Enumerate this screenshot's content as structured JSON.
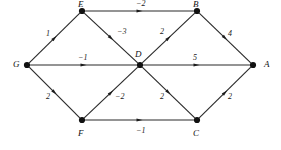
{
  "figure": {
    "kind": "directed-weighted-graph",
    "background_color": "#ffffff",
    "edge_color": "#2a2a2a",
    "node_color": "#111111"
  },
  "nodes": [
    {
      "id": "G",
      "label": "G",
      "x": 27,
      "y": 65,
      "label_x": 13,
      "label_y": 60
    },
    {
      "id": "E",
      "label": "E",
      "x": 82,
      "y": 11,
      "label_x": 78,
      "label_y": 0
    },
    {
      "id": "F",
      "label": "F",
      "x": 82,
      "y": 120,
      "label_x": 78,
      "label_y": 129
    },
    {
      "id": "D",
      "label": "D",
      "x": 140,
      "y": 65,
      "label_x": 135,
      "label_y": 50
    },
    {
      "id": "B",
      "label": "B",
      "x": 197,
      "y": 11,
      "label_x": 193,
      "label_y": 0
    },
    {
      "id": "C",
      "label": "C",
      "x": 197,
      "y": 120,
      "label_x": 193,
      "label_y": 129
    },
    {
      "id": "A",
      "label": "A",
      "x": 253,
      "y": 65,
      "label_x": 264,
      "label_y": 60
    }
  ],
  "edges": [
    {
      "id": "G-E",
      "from": "G",
      "to": "E",
      "weight": "1",
      "label_x": 46,
      "label_y": 30
    },
    {
      "id": "G-D",
      "from": "G",
      "to": "D",
      "weight": "−1",
      "label_x": 78,
      "label_y": 54
    },
    {
      "id": "G-F",
      "from": "G",
      "to": "F",
      "weight": "2",
      "label_x": 46,
      "label_y": 93
    },
    {
      "id": "E-B",
      "from": "E",
      "to": "B",
      "weight": "−2",
      "label_x": 136,
      "label_y": 0
    },
    {
      "id": "E-D",
      "from": "E",
      "to": "D",
      "weight": "−3",
      "label_x": 117,
      "label_y": 28
    },
    {
      "id": "D-B",
      "from": "D",
      "to": "B",
      "weight": "2",
      "label_x": 160,
      "label_y": 28
    },
    {
      "id": "D-A",
      "from": "D",
      "to": "A",
      "weight": "5",
      "label_x": 193,
      "label_y": 54
    },
    {
      "id": "D-C",
      "from": "D",
      "to": "C",
      "weight": "2",
      "label_x": 160,
      "label_y": 93
    },
    {
      "id": "F-D",
      "from": "F",
      "to": "D",
      "weight": "−2",
      "label_x": 115,
      "label_y": 93
    },
    {
      "id": "F-C",
      "from": "F",
      "to": "C",
      "weight": "−1",
      "label_x": 136,
      "label_y": 127
    },
    {
      "id": "B-A",
      "from": "B",
      "to": "A",
      "weight": "4",
      "label_x": 228,
      "label_y": 30
    },
    {
      "id": "C-A",
      "from": "C",
      "to": "A",
      "weight": "2",
      "label_x": 228,
      "label_y": 93
    }
  ]
}
